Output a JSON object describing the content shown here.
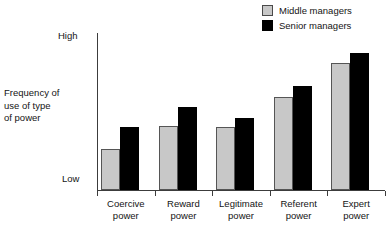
{
  "chart_data": {
    "type": "bar",
    "title": "",
    "subtitle": "",
    "xlabel": "",
    "ylabel": "Frequency of\nuse of type\nof power",
    "categories": [
      "Coercive\npower",
      "Reward\npower",
      "Legitimate\npower",
      "Referent\npower",
      "Expert\npower"
    ],
    "ytick_labels": [
      "Low",
      "High"
    ],
    "ylim": [
      0,
      100
    ],
    "grid": false,
    "legend_position": "top-right",
    "series": [
      {
        "name": "Middle managers",
        "color": "#c8c8c8",
        "border_color": "#555555",
        "values": [
          26,
          41,
          40,
          59,
          81
        ]
      },
      {
        "name": "Senior managers",
        "color": "#000000",
        "border_color": "#000000",
        "values": [
          40,
          53,
          46,
          66,
          87
        ]
      }
    ]
  },
  "legend": {
    "entries": [
      {
        "label": "Middle managers"
      },
      {
        "label": "Senior managers"
      }
    ]
  },
  "axes": {
    "y_title": "Frequency of\nuse of type\nof power",
    "y_high": "High",
    "y_low": "Low"
  }
}
